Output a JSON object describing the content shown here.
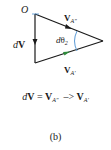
{
  "figure": {
    "labels": {
      "origin": "O",
      "dv_d": "d",
      "dv_v": "V",
      "va2_v": "V",
      "va2_sub": "A″",
      "va1_v": "V",
      "va1_sub": "A′",
      "angle_d": "d",
      "angle_theta": "θ",
      "angle_sub": "2"
    },
    "colors": {
      "line": "#1a1a1a",
      "arc": "#4a8fd0",
      "origin_mark": "#4a8fd0",
      "bottom_arrow": "#2e8b3a"
    }
  },
  "equation": {
    "lhs_d": "d",
    "lhs_v": "V",
    "eq": " = ",
    "t1_v": "V",
    "t1_sub": "A″",
    "op": "  –> ",
    "t2_v": "V",
    "t2_sub": "A′"
  },
  "caption": "(b)"
}
